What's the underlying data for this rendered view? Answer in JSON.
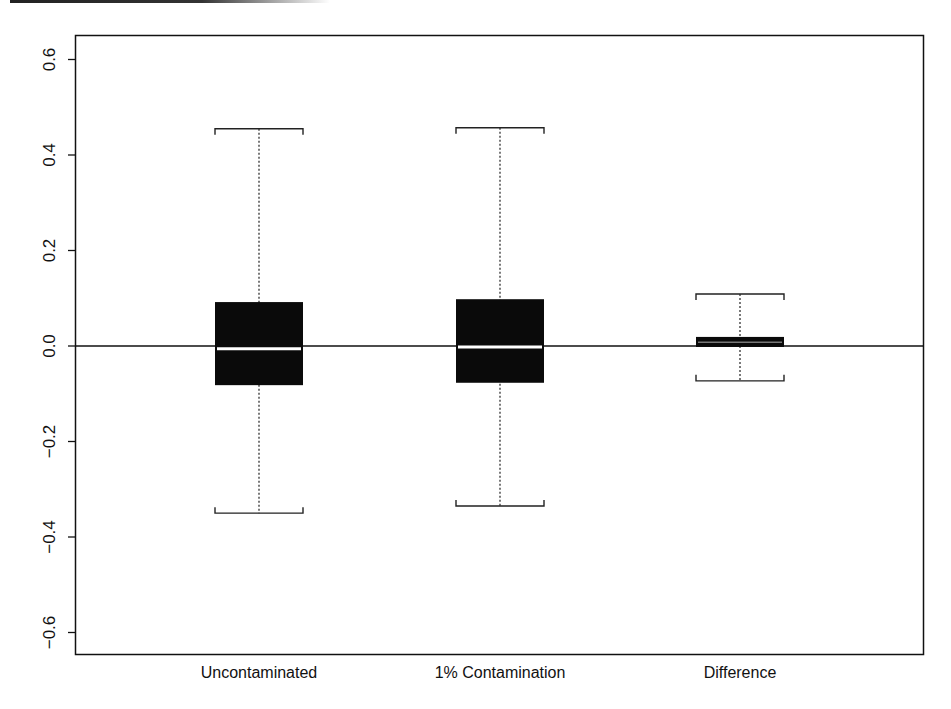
{
  "chart_data": {
    "type": "box",
    "title": "",
    "xlabel": "",
    "ylabel": "",
    "ylim": [
      -0.65,
      0.65
    ],
    "yticks": [
      -0.6,
      -0.4,
      -0.2,
      0.0,
      0.2,
      0.4,
      0.6
    ],
    "ytick_labels": [
      "−0.6",
      "−0.4",
      "−0.2",
      "0.0",
      "0.2",
      "0.4",
      "0.6"
    ],
    "categories": [
      "Uncontaminated",
      "1% Contamination",
      "Difference"
    ],
    "reference_line": 0.0,
    "grid": false,
    "series": [
      {
        "name": "Uncontaminated",
        "whisker_low": -0.35,
        "q1": -0.082,
        "median": -0.006,
        "q3": 0.092,
        "whisker_high": 0.455
      },
      {
        "name": "1% Contamination",
        "whisker_low": -0.335,
        "q1": -0.077,
        "median": -0.002,
        "q3": 0.098,
        "whisker_high": 0.457
      },
      {
        "name": "Difference",
        "whisker_low": -0.073,
        "q1": -0.002,
        "median": 0.008,
        "q3": 0.019,
        "whisker_high": 0.109
      }
    ],
    "colors": {
      "box_fill": "#0a0a0a",
      "median_line": "#ffffff",
      "axis": "#111111"
    }
  }
}
